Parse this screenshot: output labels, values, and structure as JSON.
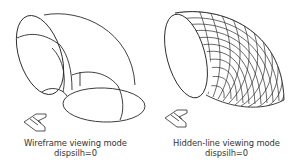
{
  "figures": [
    {
      "caption_line1": "Wireframe viewing mode",
      "caption_line2": "dispsilh=0",
      "icon": "ucs-axis-icon"
    },
    {
      "caption_line1": "Hidden-line viewing mode",
      "caption_line2": "dispsilh=0",
      "icon": "ucs-axis-icon"
    }
  ],
  "colors": {
    "line": "#2a2a2a",
    "background": "#ffffff",
    "text": "#333333"
  }
}
